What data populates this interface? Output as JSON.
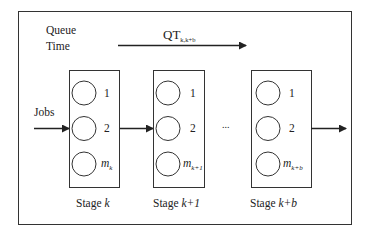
{
  "title": {
    "line1": "Queue",
    "line2": "Time"
  },
  "queue_time": {
    "label_main": "QT",
    "label_sub": "k,k+b"
  },
  "input_label": "Jobs",
  "ellipsis": "...",
  "stages": [
    {
      "name_prefix": "Stage ",
      "name_index": "k",
      "machines": [
        {
          "label": "1",
          "italic": false
        },
        {
          "label": "2",
          "italic": false
        },
        {
          "label_main": "m",
          "label_sub": "k",
          "italic": true
        }
      ]
    },
    {
      "name_prefix": "Stage ",
      "name_index": "k+1",
      "machines": [
        {
          "label": "1",
          "italic": false
        },
        {
          "label": "2",
          "italic": false
        },
        {
          "label_main": "m",
          "label_sub": "k+1",
          "italic": true
        }
      ]
    },
    {
      "name_prefix": "Stage ",
      "name_index": "k+b",
      "machines": [
        {
          "label": "1",
          "italic": false
        },
        {
          "label": "2",
          "italic": false
        },
        {
          "label_main": "m",
          "label_sub": "k+b",
          "italic": true
        }
      ]
    }
  ]
}
